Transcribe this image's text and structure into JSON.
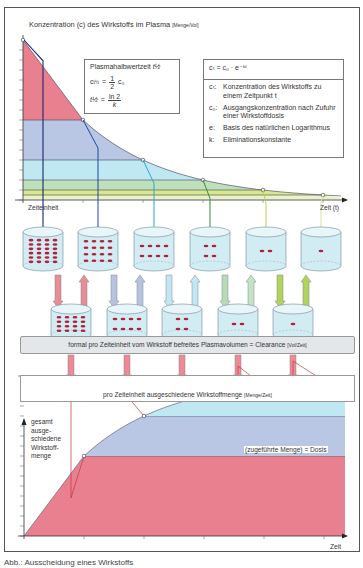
{
  "top_chart": {
    "title": "Konzentration (c) des Wirkstoffs im Plasma",
    "title_unit": "[Menge/Vol]",
    "x_label": "Zeit (t)",
    "unit_label": "Zeiteinheit",
    "points": [
      [
        0,
        0
      ],
      [
        1,
        0.5
      ],
      [
        2,
        0.25
      ],
      [
        3,
        0.125
      ],
      [
        4,
        0.0625
      ],
      [
        5,
        0.03125
      ]
    ],
    "band_colors": [
      "#e8808f",
      "#b9c6e4",
      "#bfe8f2",
      "#bfe0bc",
      "#d7e98a"
    ],
    "line_colors": [
      "#1a2a6a",
      "#1e47a8",
      "#2aa6d8",
      "#3b8a3b",
      "#b8d44a",
      "#d4e69a"
    ]
  },
  "half_life_box": {
    "title": "Plasmahalbwertzeit",
    "title_symbol": "t½",
    "eq1_left": "c",
    "eq1_sub": "t½",
    "eq1_frac_num": "1",
    "eq1_frac_den": "2",
    "eq1_right": "c₀",
    "eq2_left": "t½",
    "eq2_num": "ln 2",
    "eq2_den": "k"
  },
  "formula_box": {
    "formula": "cₜ = c₀ · e⁻ᵏᵗ",
    "definitions": [
      {
        "key": "cₜ:",
        "text": "Konzentration des Wirkstoffs zu einem Zeitpunkt t"
      },
      {
        "key": "c₀:",
        "text": "Ausgangskonzentration nach Zufuhr einer Wirkstoffdosis"
      },
      {
        "key": "e:",
        "text": "Basis des natürlichen Logarithmus"
      },
      {
        "key": "k:",
        "text": "Eliminationskonstante"
      }
    ]
  },
  "cylinders": {
    "dot_counts": [
      24,
      16,
      8,
      4,
      2,
      1
    ],
    "small_dot_counts": [
      16,
      8,
      4,
      2,
      1
    ]
  },
  "clearance_band": {
    "text": "formal pro Zeiteinheit vom Wirkstoff befreites Plasmavolumen = Clearance",
    "unit": "[Vol/Zeit]"
  },
  "excreted_band": {
    "text": "pro Zeiteinheit ausgeschiedene Wirkstoffmenge",
    "unit": "[Menge/Zeit]",
    "dot_counts": [
      16,
      8,
      4,
      2,
      1
    ]
  },
  "bottom_chart": {
    "y_label_lines": [
      "gesamt",
      "ausge-",
      "schiedene",
      "Wirkstoff-",
      "menge"
    ],
    "x_label": "Zeit",
    "dose_label": "(zugeführte Menge) = Dosis",
    "cumulative": [
      0,
      0.5,
      0.75,
      0.875,
      0.9375,
      0.96875
    ]
  },
  "caption": "Abb.: Ausscheidung eines Wirkstoffs"
}
